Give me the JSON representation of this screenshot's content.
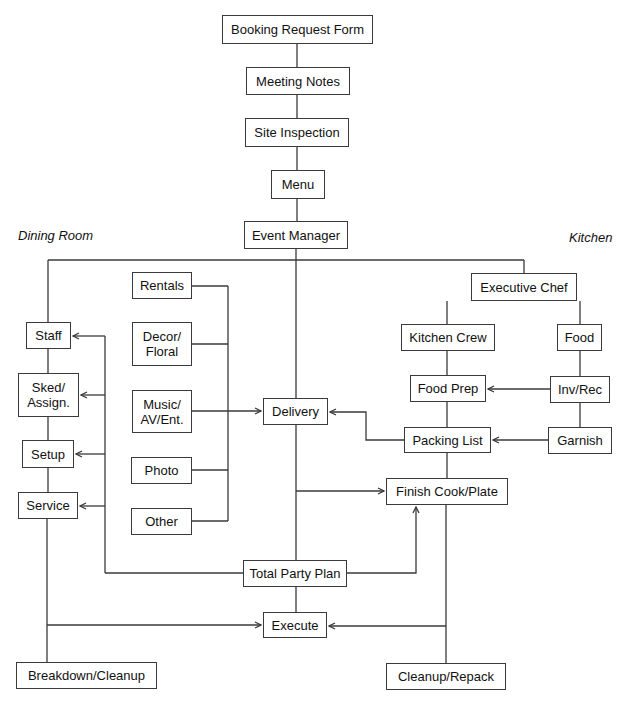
{
  "diagram": {
    "type": "flowchart",
    "colors": {
      "line": "#3a3a3a",
      "box_border": "#3a3a3a",
      "background": "#ffffff",
      "text": "#111111"
    },
    "section_labels": {
      "dining_room": "Dining Room",
      "kitchen": "Kitchen"
    },
    "nodes": {
      "booking_request_form": "Booking Request Form",
      "meeting_notes": "Meeting Notes",
      "site_inspection": "Site Inspection",
      "menu": "Menu",
      "event_manager": "Event Manager",
      "rentals": "Rentals",
      "decor_floral": "Decor/\nFloral",
      "music_av_ent": "Music/\nAV/Ent.",
      "photo": "Photo",
      "other": "Other",
      "staff": "Staff",
      "sked_assign": "Sked/\nAssign.",
      "setup": "Setup",
      "service": "Service",
      "delivery": "Delivery",
      "executive_chef": "Executive Chef",
      "kitchen_crew": "Kitchen Crew",
      "food": "Food",
      "food_prep": "Food Prep",
      "inv_rec": "Inv/Rec",
      "packing_list": "Packing List",
      "garnish": "Garnish",
      "finish_cook_plate": "Finish Cook/Plate",
      "total_party_plan": "Total Party Plan",
      "execute": "Execute",
      "breakdown_cleanup": "Breakdown/Cleanup",
      "cleanup_repack": "Cleanup/Repack"
    },
    "edges": [
      [
        "Booking Request Form",
        "Meeting Notes"
      ],
      [
        "Meeting Notes",
        "Site Inspection"
      ],
      [
        "Site Inspection",
        "Menu"
      ],
      [
        "Menu",
        "Event Manager"
      ],
      [
        "Event Manager",
        "Staff"
      ],
      [
        "Event Manager",
        "Executive Chef"
      ],
      [
        "Event Manager",
        "Total Party Plan"
      ],
      [
        "Rentals/Decor/Music/Photo/Other",
        "Delivery"
      ],
      [
        "Packing List",
        "Delivery"
      ],
      [
        "Event Manager line",
        "Finish Cook/Plate"
      ],
      [
        "Total Party Plan",
        "Staff/Sked/Setup/Service"
      ],
      [
        "Total Party Plan",
        "Finish Cook/Plate"
      ],
      [
        "Total Party Plan",
        "Execute"
      ],
      [
        "Staff",
        "Sked/Assign."
      ],
      [
        "Sked/Assign.",
        "Setup"
      ],
      [
        "Setup",
        "Service"
      ],
      [
        "Service",
        "Breakdown/Cleanup"
      ],
      [
        "Service line",
        "Execute"
      ],
      [
        "Executive Chef",
        "Kitchen Crew"
      ],
      [
        "Executive Chef",
        "Food"
      ],
      [
        "Kitchen Crew",
        "Food Prep"
      ],
      [
        "Food",
        "Inv/Rec"
      ],
      [
        "Inv/Rec",
        "Food Prep"
      ],
      [
        "Inv/Rec",
        "Garnish"
      ],
      [
        "Garnish",
        "Packing List"
      ],
      [
        "Food Prep",
        "Packing List"
      ],
      [
        "Packing List",
        "Finish Cook/Plate"
      ],
      [
        "Finish Cook/Plate",
        "Cleanup/Repack"
      ],
      [
        "Kitchen line",
        "Execute"
      ]
    ]
  }
}
